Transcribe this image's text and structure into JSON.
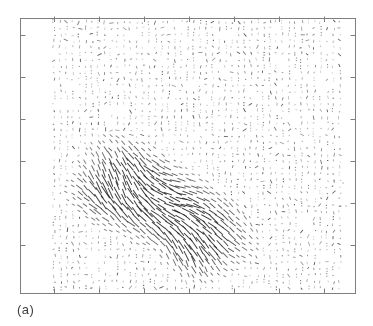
{
  "figure": {
    "panel_label": "(a)",
    "background_color": "#ffffff"
  },
  "chart_data": {
    "type": "quiver",
    "title": "",
    "xlabel": "",
    "ylabel": "",
    "legend": "none",
    "tick_labels": "none",
    "arrowheads": false,
    "axes": {
      "frame": {
        "left": 20,
        "top": 18,
        "right": 355,
        "bottom": 293
      },
      "frame_color": "#7e7e7e",
      "tick_color": "#7e7e7e",
      "tick_length": 5,
      "tick_direction": "in",
      "x_ticks_px": [
        54,
        99,
        144,
        189,
        234,
        279,
        324
      ],
      "y_ticks_px": [
        35,
        77,
        119,
        161,
        203,
        245
      ]
    },
    "grid": {
      "x_start": 54,
      "x_end": 340,
      "y_start": 22,
      "y_end": 288,
      "dx": 6.35,
      "dy": 6.33,
      "jitter": 2.4
    },
    "background_field": {
      "color": "#1a1a1a",
      "blank_prob": 0.1,
      "corner_extra_blank": 0.18,
      "min_alpha": 0.2,
      "max_alpha": 0.62,
      "dark_prob": 0.08,
      "dark_alpha": 0.78,
      "line_width": 0.85
    },
    "motion_blobs": [
      {
        "cx": 150,
        "cy": 205,
        "sx": 40,
        "sy": 21,
        "rot": 20,
        "w": 1.0
      },
      {
        "cx": 138,
        "cy": 175,
        "sx": 30,
        "sy": 18,
        "rot": 35,
        "w": 0.85
      },
      {
        "cx": 205,
        "cy": 228,
        "sx": 30,
        "sy": 20,
        "rot": 30,
        "w": 0.95
      },
      {
        "cx": 190,
        "cy": 252,
        "sx": 20,
        "sy": 14,
        "rot": 50,
        "w": 0.7
      },
      {
        "cx": 108,
        "cy": 195,
        "sx": 22,
        "sy": 15,
        "rot": 5,
        "w": 0.7
      }
    ],
    "motion_stroke": {
      "color": "#1a1a1a",
      "max_length": 14.5,
      "threshold": 0.17,
      "min_alpha": 0.45,
      "max_alpha": 0.85,
      "line_width": 0.95,
      "angle": {
        "base": 34,
        "w1": {
          "amp": 12,
          "fx": 0.05,
          "fy": -0.04,
          "ph": 3.2
        },
        "w2": {
          "amp": 8,
          "f": 0.035,
          "ph": 4.0
        },
        "noise": 9,
        "min": 8,
        "max": 72
      },
      "steep_patches": [
        {
          "cx": 122,
          "cy": 170,
          "r": 45,
          "amp": 14
        },
        {
          "cx": 196,
          "cy": 252,
          "r": 40,
          "amp": 12
        },
        {
          "cx": 212,
          "cy": 228,
          "r": 35,
          "amp": 8
        }
      ]
    },
    "stray_marks": [
      {
        "x": 343,
        "y": 183
      },
      {
        "x": 346,
        "y": 206
      }
    ],
    "seed": 7
  }
}
